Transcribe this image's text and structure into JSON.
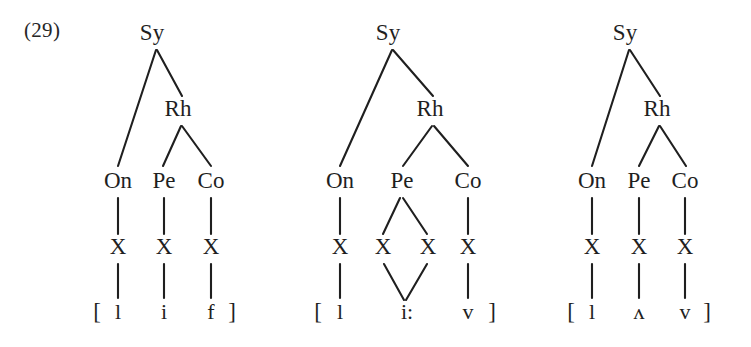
{
  "figure": {
    "example_number": "(29)",
    "ink_color": "#1f1f1f",
    "background_color": "#ffffff"
  },
  "labels": {
    "syllable": "Sy",
    "rhyme": "Rh",
    "onset": "On",
    "peak": "Pe",
    "coda": "Co",
    "skeletal": "X",
    "bracket_open": "[",
    "bracket_close": "]"
  },
  "trees": [
    {
      "id": "tree-1",
      "root": "Sy",
      "rhyme": "Rh",
      "constituents": [
        "On",
        "Pe",
        "Co"
      ],
      "skeleton": [
        "X",
        "X",
        "X"
      ],
      "segments": [
        "l",
        "i",
        "f"
      ],
      "transcription": "[ l i f ]",
      "word_gloss": "leaf"
    },
    {
      "id": "tree-2",
      "root": "Sy",
      "rhyme": "Rh",
      "constituents": [
        "On",
        "Pe",
        "Co"
      ],
      "skeleton": [
        "X",
        "X",
        "X",
        "X"
      ],
      "segments": [
        "l",
        "i:",
        "v"
      ],
      "transcription": "[ l i: v ]",
      "word_gloss": "leave"
    },
    {
      "id": "tree-3",
      "root": "Sy",
      "rhyme": "Rh",
      "constituents": [
        "On",
        "Pe",
        "Co"
      ],
      "skeleton": [
        "X",
        "X",
        "X"
      ],
      "segments": [
        "l",
        "ʌ",
        "v"
      ],
      "transcription": "[ l ʌ v ]",
      "word_gloss": "love"
    }
  ],
  "tree1": {
    "sy": "Sy",
    "rh": "Rh",
    "on": "On",
    "pe": "Pe",
    "co": "Co",
    "x1": "X",
    "x2": "X",
    "x3": "X",
    "seg1": "l",
    "seg2": "i",
    "seg3": "f",
    "open": "[",
    "close": "]"
  },
  "tree2": {
    "sy": "Sy",
    "rh": "Rh",
    "on": "On",
    "pe": "Pe",
    "co": "Co",
    "x1": "X",
    "x2": "X",
    "x3": "X",
    "x4": "X",
    "seg1": "l",
    "seg2": "i:",
    "seg3": "v",
    "open": "[",
    "close": "]"
  },
  "tree3": {
    "sy": "Sy",
    "rh": "Rh",
    "on": "On",
    "pe": "Pe",
    "co": "Co",
    "x1": "X",
    "x2": "X",
    "x3": "X",
    "seg1": "l",
    "seg2": "ʌ",
    "seg3": "v",
    "open": "[",
    "close": "]"
  }
}
